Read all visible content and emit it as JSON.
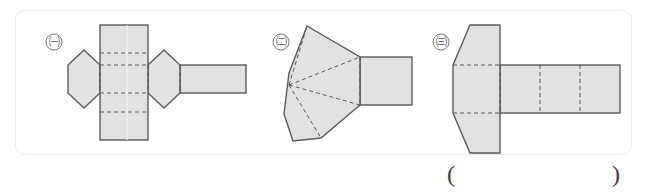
{
  "frame": {
    "border_color": "#ebebeb",
    "background": "#ffffff"
  },
  "style": {
    "shape_fill": "#e2e2e2",
    "shape_stroke": "#5a5a5a",
    "fold_line_color": "#555555",
    "label_color": "#4a4a4a"
  },
  "nets": [
    {
      "label": "㈠",
      "name": "net-hexagonal-prism",
      "description": "Net of a hexagonal prism: a vertical strip of four rectangular faces with horizontal dashed fold lines, a hexagon attached on the left, and a hexagon plus rectangle attached on the right.",
      "parts": [
        "vertical-rectangle-strip-4-panels",
        "left-hexagon",
        "right-hexagon",
        "right-rectangle-tab"
      ],
      "fold_line_count": 6
    },
    {
      "label": "㈡",
      "name": "net-pyramid-fan",
      "description": "Net of a pyramid: a fan of triangular faces radiating from a single left apex with dashed fold lines, attached to a rectangle on the right.",
      "parts": [
        "fan-of-triangles",
        "right-rectangle"
      ],
      "fold_line_count": 4
    },
    {
      "label": "㈢",
      "name": "net-hexagon-strip",
      "description": "Net of a prism: an elongated hexagon on the left with dashed fold lines, attached to a horizontal rectangular strip divided into three panels by dashed fold lines.",
      "parts": [
        "left-elongated-hexagon",
        "horizontal-rectangle-strip-3-panels"
      ],
      "fold_line_count": 5
    }
  ],
  "answer": {
    "open_paren": "(",
    "close_paren": ")",
    "value": ""
  }
}
